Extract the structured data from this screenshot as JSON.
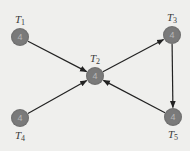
{
  "diagram": {
    "type": "directed-graph",
    "colors": {
      "background": "#efefed",
      "node_fill": "#7a7a7a",
      "node_text": "#b8b8b8",
      "edge": "#222222",
      "label": "#3a3a3a"
    },
    "nodes": [
      {
        "id": "T1",
        "letter": "T",
        "sub": "1",
        "value": "4",
        "x": 20,
        "y": 37,
        "label_pos": "above"
      },
      {
        "id": "T2",
        "letter": "T",
        "sub": "2",
        "value": "4",
        "x": 95,
        "y": 76,
        "label_pos": "above"
      },
      {
        "id": "T3",
        "letter": "T",
        "sub": "3",
        "value": "4",
        "x": 172,
        "y": 35,
        "label_pos": "above"
      },
      {
        "id": "T4",
        "letter": "T",
        "sub": "4",
        "value": "4",
        "x": 20,
        "y": 118,
        "label_pos": "below"
      },
      {
        "id": "T5",
        "letter": "T",
        "sub": "5",
        "value": "4",
        "x": 173,
        "y": 117,
        "label_pos": "below"
      }
    ],
    "edges": [
      {
        "from": "T1",
        "to": "T2"
      },
      {
        "from": "T4",
        "to": "T2"
      },
      {
        "from": "T2",
        "to": "T3"
      },
      {
        "from": "T3",
        "to": "T5"
      },
      {
        "from": "T5",
        "to": "T2"
      }
    ]
  }
}
